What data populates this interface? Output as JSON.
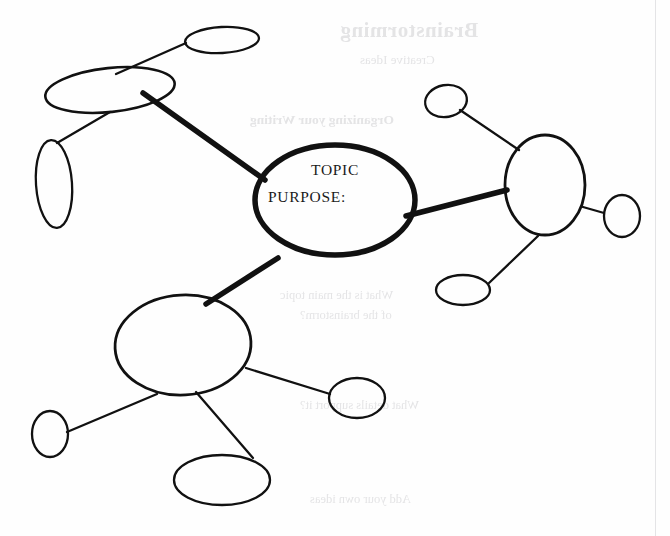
{
  "document": {
    "type": "mind-map-worksheet",
    "ink_color": "#111111",
    "paper_color": "#fefefe",
    "bleed_color": "#cfcfd2",
    "width": 670,
    "height": 536
  },
  "center_node": {
    "name": "central-topic-node",
    "line_1": "TOPIC",
    "line_2": "PURPOSE:",
    "cx": 335,
    "cy": 200,
    "rx": 80,
    "ry": 55,
    "stroke_width": 5.5
  },
  "branches": [
    {
      "id": "branch-upper-left",
      "main": {
        "name": "branch-node-upper-left",
        "cx": 110,
        "cy": 90,
        "rx": 65,
        "ry": 22,
        "rotate": -6,
        "stroke_width": 2.6
      },
      "connector": {
        "from": [
          265,
          180
        ],
        "to": [
          143,
          93
        ],
        "stroke_width": 5.5,
        "weight": "thick"
      },
      "children": [
        {
          "name": "sub-node-upper-left-top",
          "cx": 222,
          "cy": 40,
          "rx": 37,
          "ry": 13,
          "rotate": -3,
          "stroke_width": 2.3,
          "connector": {
            "from": [
              186,
              43
            ],
            "to": [
              116,
              74
            ],
            "stroke_width": 2.3,
            "weight": "thin"
          }
        },
        {
          "name": "sub-node-upper-left-tall",
          "cx": 54,
          "cy": 184,
          "rx": 18,
          "ry": 44,
          "rotate": -4,
          "stroke_width": 2.3,
          "connector": {
            "from": [
              57,
              143
            ],
            "to": [
              110,
              112
            ],
            "stroke_width": 2.3,
            "weight": "thin"
          }
        }
      ]
    },
    {
      "id": "branch-right",
      "main": {
        "name": "branch-node-right",
        "cx": 545,
        "cy": 185,
        "rx": 40,
        "ry": 50,
        "rotate": 0,
        "stroke_width": 2.8
      },
      "connector": {
        "from": [
          406,
          216
        ],
        "to": [
          507,
          190
        ],
        "stroke_width": 5.5,
        "weight": "thick"
      },
      "children": [
        {
          "name": "sub-node-right-top",
          "cx": 446,
          "cy": 101,
          "rx": 21,
          "ry": 16,
          "rotate": -10,
          "stroke_width": 2.3,
          "connector": {
            "from": [
              460,
              110
            ],
            "to": [
              519,
              150
            ],
            "stroke_width": 2.3,
            "weight": "thin"
          }
        },
        {
          "name": "sub-node-right-east",
          "cx": 622,
          "cy": 216,
          "rx": 18,
          "ry": 21,
          "rotate": 0,
          "stroke_width": 2.3,
          "connector": {
            "from": [
              604,
              213
            ],
            "to": [
              583,
              207
            ],
            "stroke_width": 2.3,
            "weight": "thin"
          }
        },
        {
          "name": "sub-node-right-bottom",
          "cx": 463,
          "cy": 290,
          "rx": 27,
          "ry": 15,
          "rotate": 0,
          "stroke_width": 2.3,
          "connector": {
            "from": [
              489,
              283
            ],
            "to": [
              538,
              236
            ],
            "stroke_width": 2.3,
            "weight": "thin"
          }
        }
      ]
    },
    {
      "id": "branch-bottom",
      "main": {
        "name": "branch-node-bottom",
        "cx": 183,
        "cy": 345,
        "rx": 68,
        "ry": 50,
        "rotate": -3,
        "stroke_width": 2.8
      },
      "connector": {
        "from": [
          278,
          258
        ],
        "to": [
          206,
          304
        ],
        "stroke_width": 5.5,
        "weight": "thick"
      },
      "children": [
        {
          "name": "sub-node-bottom-left",
          "cx": 50,
          "cy": 434,
          "rx": 18,
          "ry": 23,
          "rotate": 0,
          "stroke_width": 2.3,
          "connector": {
            "from": [
              67,
              432
            ],
            "to": [
              157,
              394
            ],
            "stroke_width": 2.3,
            "weight": "thin"
          }
        },
        {
          "name": "sub-node-bottom-right",
          "cx": 357,
          "cy": 398,
          "rx": 28,
          "ry": 20,
          "rotate": 0,
          "stroke_width": 2.3,
          "connector": {
            "from": [
              330,
              394
            ],
            "to": [
              246,
              368
            ],
            "stroke_width": 2.3,
            "weight": "thin"
          }
        },
        {
          "name": "sub-node-bottom-center",
          "cx": 222,
          "cy": 480,
          "rx": 48,
          "ry": 25,
          "rotate": 0,
          "stroke_width": 2.3,
          "connector": {
            "from": [
              253,
              458
            ],
            "to": [
              196,
              392
            ],
            "stroke_width": 2.3,
            "weight": "thin"
          }
        }
      ]
    }
  ],
  "bleed_through": [
    {
      "name": "bleed-title",
      "text": "Brainstorming",
      "class": "g-title",
      "left": 340,
      "top": 18
    },
    {
      "name": "bleed-subtitle",
      "text": "Creative Ideas",
      "class": "g-sub",
      "left": 360,
      "top": 52
    },
    {
      "name": "bleed-heading-1",
      "text": "Organizing your Writing",
      "class": "g-head",
      "left": 250,
      "top": 112
    },
    {
      "name": "bleed-line-1",
      "text": "What is the main topic",
      "class": "g-body",
      "left": 280,
      "top": 288
    },
    {
      "name": "bleed-line-2",
      "text": "of the brainstorm?",
      "class": "g-body",
      "left": 300,
      "top": 308
    },
    {
      "name": "bleed-line-3",
      "text": "What details support it?",
      "class": "g-body",
      "left": 300,
      "top": 398
    },
    {
      "name": "bleed-line-4",
      "text": "Add your own ideas",
      "class": "g-body",
      "left": 310,
      "top": 492
    }
  ]
}
